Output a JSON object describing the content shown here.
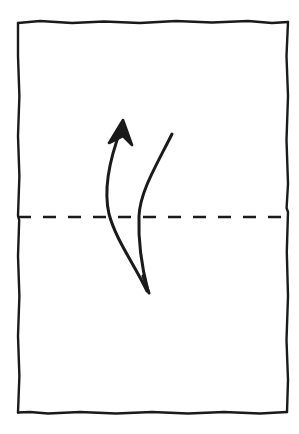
{
  "figure": {
    "canvas": {
      "width": 299,
      "height": 434,
      "background_color": "#ffffff"
    },
    "ink_color": "#1a1a1a",
    "stroke_widths": {
      "paper_edge": 2.4,
      "fold_line": 2.4,
      "motion_arrow": 3.0
    }
  },
  "paper": {
    "label": "paper-sheet",
    "shape": "rectangle",
    "style": "hand-drawn",
    "corners": {
      "top_left": [
        18,
        22
      ],
      "top_right": [
        288,
        23
      ],
      "bottom_right": [
        288,
        412
      ],
      "bottom_left": [
        18,
        412
      ]
    },
    "edges": {
      "top": "M 18 23 L 40 21 L 72 23 L 104 21.5 L 140 23 L 176 21 L 212 22.5 L 248 21 L 272 23 L 288 22",
      "right": "M 288 22 L 286.5 56 L 288 96 L 286.5 140 L 288 184 L 286.6 208 L 288 212 L 286.8 252 L 288 296 L 286.5 340 L 288 380 L 287 412",
      "bottom": "M 287 412 L 260 413.5 L 224 412 L 188 413.5 L 152 412 L 116 413.5 L 80 412 L 48 413.5 L 30 412 L 18 412.5",
      "left": "M 18 412.5 L 19.4 376 L 18 336 L 19.4 296 L 18 256 L 19.2 220 L 18 216 L 19.4 176 L 18 136 L 19.4 96 L 18 56 L 18 23"
    }
  },
  "fold_line": {
    "label": "valley-fold-line",
    "type": "dashed",
    "orientation": "horizontal",
    "y": 217,
    "x_start": 18,
    "x_end": 288,
    "dash_length": 13,
    "gap_length": 12,
    "meaning": "fold here"
  },
  "motion_arrow": {
    "label": "fold-and-unfold-arrow",
    "meaning": "fold up then unfold",
    "convergence_point": [
      148,
      292
    ],
    "left_stroke": {
      "name": "fold-arrow-shaft",
      "path": "M 147 291 C 133 262 116 240 109 214 C 103 188 110 158 121 129",
      "has_arrowhead": true,
      "arrowhead_tip": [
        123,
        121
      ],
      "arrowhead_direction": "up"
    },
    "right_stroke": {
      "name": "unfold-arrow-shaft",
      "path": "M 172 134 C 156 166 140 192 139 216 C 138 242 142 268 148 291",
      "has_arrowhead": false,
      "open_tip": [
        172,
        134
      ]
    },
    "bottom_tip": {
      "name": "arrow-bottom-point",
      "point": [
        148,
        292
      ],
      "shape": "converging-point"
    },
    "arrowhead_top": {
      "left_barb_path": "M 123 121 L 110 142",
      "right_barb_path": "M 123 121 L 131 144",
      "fill_polygon": "123,120 109,143 123,136 132,145"
    }
  }
}
